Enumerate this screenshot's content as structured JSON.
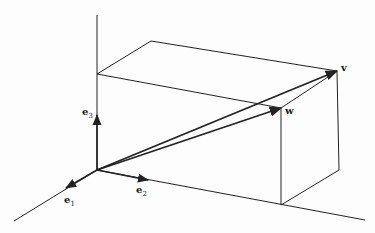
{
  "figure": {
    "type": "3d-vector-diagram",
    "colors": {
      "line": "#222222",
      "background": "#fdfdfd"
    },
    "labels": {
      "e1": {
        "base": "e",
        "sub": "1"
      },
      "e2": {
        "base": "e",
        "sub": "2"
      },
      "e3": {
        "base": "e",
        "sub": "3"
      },
      "v": "v",
      "w": "w"
    },
    "points": {
      "origin": [
        97,
        170
      ],
      "e1_tip": [
        66,
        188
      ],
      "e2_tip": [
        148,
        180
      ],
      "e3_tip": [
        97,
        115
      ],
      "axis1_end": [
        14,
        221
      ],
      "axis2_end": [
        365,
        220
      ],
      "axis3_top": [
        97,
        15
      ],
      "box_top_back_left": [
        97,
        74
      ],
      "box_top_back_right": [
        151,
        41
      ],
      "v": [
        337,
        71
      ],
      "w": [
        281,
        108
      ],
      "box_bottom_front": [
        281,
        205
      ],
      "box_bottom_right": [
        339,
        170
      ]
    }
  }
}
